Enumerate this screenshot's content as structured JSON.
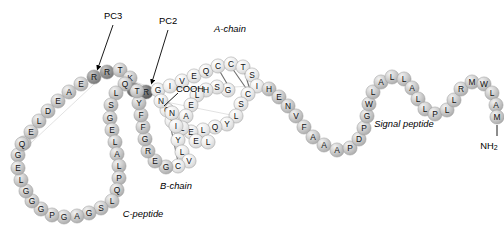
{
  "figure": {
    "background_color": "#ffffff",
    "bead_fill_light": "#e3e3e3",
    "bead_fill_mid": "#c9c9c9",
    "bead_fill_dark": "#8f8f8f",
    "bead_fill_darkest": "#6a6a6a",
    "bead_stroke": "#9a9a9a",
    "bond_color": "#6e6e6e"
  },
  "labels": {
    "pc3": "PC3",
    "pc2": "PC2",
    "a_chain": "A-chain",
    "b_chain": "B-chain",
    "c_peptide": "C-peptide",
    "signal_peptide": "Signal peptide",
    "cooh": "COOH",
    "nh2_main": "NH",
    "nh2_sub": "2"
  },
  "chart_data": {
    "type": "diagram",
    "segments": [
      {
        "name": "A-chain",
        "sequence": "GIVEQCCTSICSLYQLENYCN"
      },
      {
        "name": "B-chain",
        "sequence": "FVNQHLCGSHLVEALYLVCGERGFFYTKPT"
      },
      {
        "name": "C-peptide",
        "sequence": "EAEDLQVGQVELGGGPGAGSLQPLALEGSLQKR"
      },
      {
        "name": "Signal peptide",
        "sequence": "MALWMRLLPLLALLALWGPDPAAA"
      }
    ],
    "cleavage_sites": [
      "PC3",
      "PC2"
    ],
    "termini": [
      "NH2",
      "COOH"
    ],
    "disulfide_bonds": 3
  },
  "residues": [
    {
      "id": "r1",
      "letter": "G",
      "x": 18,
      "y": 155,
      "tone": "mid"
    },
    {
      "id": "r2",
      "letter": "V",
      "x": 24,
      "y": 143,
      "tone": "mid"
    },
    {
      "id": "r3",
      "letter": "E",
      "x": 31,
      "y": 132,
      "tone": "mid"
    },
    {
      "id": "r4",
      "letter": "L",
      "x": 39,
      "y": 121,
      "tone": "mid"
    },
    {
      "id": "r5",
      "letter": "D",
      "x": 48,
      "y": 111,
      "tone": "mid"
    },
    {
      "id": "r6",
      "letter": "E",
      "x": 58,
      "y": 101,
      "tone": "mid"
    },
    {
      "id": "r7",
      "letter": "A",
      "x": 69,
      "y": 92,
      "tone": "mid"
    },
    {
      "id": "r8",
      "letter": "E",
      "x": 81,
      "y": 84,
      "tone": "mid"
    },
    {
      "id": "r9",
      "letter": "R",
      "x": 94,
      "y": 77,
      "tone": "dark"
    },
    {
      "id": "r10",
      "letter": "R",
      "x": 107,
      "y": 72,
      "tone": "dark"
    },
    {
      "id": "r11",
      "letter": "T",
      "x": 120,
      "y": 70,
      "tone": "mid"
    },
    {
      "id": "r12",
      "letter": "K",
      "x": 130,
      "y": 78,
      "tone": "mid"
    },
    {
      "id": "r13",
      "letter": "K",
      "x": 134,
      "y": 90,
      "tone": "darkest"
    },
    {
      "id": "r14",
      "letter": "R",
      "x": 146,
      "y": 92,
      "tone": "darkest"
    },
    {
      "id": "r15",
      "letter": "G",
      "x": 158,
      "y": 90,
      "tone": "light"
    },
    {
      "id": "r16",
      "letter": "I",
      "x": 170,
      "y": 86,
      "tone": "light"
    },
    {
      "id": "r17",
      "letter": "V",
      "x": 182,
      "y": 81,
      "tone": "light"
    },
    {
      "id": "r18",
      "letter": "E",
      "x": 194,
      "y": 76,
      "tone": "light"
    },
    {
      "id": "r19",
      "letter": "Q",
      "x": 206,
      "y": 71,
      "tone": "light"
    },
    {
      "id": "r20",
      "letter": "C",
      "x": 218,
      "y": 66,
      "tone": "light"
    },
    {
      "id": "r21",
      "letter": "C",
      "x": 231,
      "y": 64,
      "tone": "light"
    },
    {
      "id": "r22",
      "letter": "T",
      "x": 243,
      "y": 67,
      "tone": "light"
    },
    {
      "id": "r23",
      "letter": "S",
      "x": 252,
      "y": 75,
      "tone": "light"
    },
    {
      "id": "r24",
      "letter": "I",
      "x": 257,
      "y": 86,
      "tone": "light"
    },
    {
      "id": "r25",
      "letter": "C",
      "x": 248,
      "y": 94,
      "tone": "light"
    },
    {
      "id": "r26",
      "letter": "S",
      "x": 241,
      "y": 104,
      "tone": "light"
    },
    {
      "id": "r27",
      "letter": "L",
      "x": 236,
      "y": 116,
      "tone": "light"
    },
    {
      "id": "r28",
      "letter": "Y",
      "x": 227,
      "y": 124,
      "tone": "light"
    },
    {
      "id": "r29",
      "letter": "Q",
      "x": 215,
      "y": 127,
      "tone": "light"
    },
    {
      "id": "r30",
      "letter": "L",
      "x": 203,
      "y": 130,
      "tone": "light"
    },
    {
      "id": "r31",
      "letter": "E",
      "x": 191,
      "y": 132,
      "tone": "light"
    },
    {
      "id": "r32",
      "letter": "N",
      "x": 180,
      "y": 129,
      "tone": "light"
    },
    {
      "id": "r33",
      "letter": "Y",
      "x": 172,
      "y": 121,
      "tone": "light"
    },
    {
      "id": "r34",
      "letter": "C",
      "x": 167,
      "y": 110,
      "tone": "light"
    },
    {
      "id": "r35",
      "letter": "N",
      "x": 161,
      "y": 101,
      "tone": "light"
    },
    {
      "id": "b1",
      "letter": "G",
      "x": 228,
      "y": 90,
      "tone": "light"
    },
    {
      "id": "b2",
      "letter": "S",
      "x": 217,
      "y": 87,
      "tone": "light"
    },
    {
      "id": "b3",
      "letter": "H",
      "x": 206,
      "y": 90,
      "tone": "light"
    },
    {
      "id": "b4",
      "letter": "L",
      "x": 197,
      "y": 95,
      "tone": "light"
    },
    {
      "id": "b5",
      "letter": "E",
      "x": 191,
      "y": 105,
      "tone": "light"
    },
    {
      "id": "b6",
      "letter": "A",
      "x": 186,
      "y": 116,
      "tone": "light"
    },
    {
      "id": "b7",
      "letter": "L",
      "x": 182,
      "y": 128,
      "tone": "light"
    },
    {
      "id": "b8",
      "letter": "Y",
      "x": 178,
      "y": 140,
      "tone": "light"
    },
    {
      "id": "b9",
      "letter": "L",
      "x": 182,
      "y": 152,
      "tone": "light"
    },
    {
      "id": "b10",
      "letter": "V",
      "x": 189,
      "y": 161,
      "tone": "light"
    },
    {
      "id": "b11",
      "letter": "C",
      "x": 178,
      "y": 166,
      "tone": "light"
    },
    {
      "id": "b12",
      "letter": "G",
      "x": 166,
      "y": 167,
      "tone": "mid"
    },
    {
      "id": "b13",
      "letter": "E",
      "x": 155,
      "y": 161,
      "tone": "mid"
    },
    {
      "id": "b14",
      "letter": "R",
      "x": 148,
      "y": 151,
      "tone": "mid"
    },
    {
      "id": "b15",
      "letter": "G",
      "x": 145,
      "y": 139,
      "tone": "mid"
    },
    {
      "id": "b16",
      "letter": "F",
      "x": 143,
      "y": 127,
      "tone": "mid"
    },
    {
      "id": "b17",
      "letter": "F",
      "x": 141,
      "y": 115,
      "tone": "mid"
    },
    {
      "id": "b18",
      "letter": "Y",
      "x": 139,
      "y": 103,
      "tone": "mid"
    },
    {
      "id": "b19",
      "letter": "T",
      "x": 137,
      "y": 91,
      "tone": "mid"
    },
    {
      "id": "bn1",
      "letter": "N",
      "x": 172,
      "y": 113,
      "tone": "light"
    },
    {
      "id": "bn2",
      "letter": "I",
      "x": 176,
      "y": 126,
      "tone": "light"
    },
    {
      "id": "bn3",
      "letter": "E",
      "x": 196,
      "y": 141,
      "tone": "light"
    },
    {
      "id": "bn4",
      "letter": "L",
      "x": 208,
      "y": 142,
      "tone": "light"
    },
    {
      "id": "c1",
      "letter": "Q",
      "x": 125,
      "y": 84,
      "tone": "mid"
    },
    {
      "id": "c2",
      "letter": "L",
      "x": 116,
      "y": 93,
      "tone": "mid"
    },
    {
      "id": "c3",
      "letter": "S",
      "x": 111,
      "y": 105,
      "tone": "mid"
    },
    {
      "id": "c4",
      "letter": "G",
      "x": 110,
      "y": 118,
      "tone": "mid"
    },
    {
      "id": "c5",
      "letter": "E",
      "x": 112,
      "y": 130,
      "tone": "mid"
    },
    {
      "id": "c6",
      "letter": "L",
      "x": 115,
      "y": 142,
      "tone": "mid"
    },
    {
      "id": "c7",
      "letter": "A",
      "x": 117,
      "y": 154,
      "tone": "mid"
    },
    {
      "id": "c8",
      "letter": "L",
      "x": 119,
      "y": 166,
      "tone": "mid"
    },
    {
      "id": "c9",
      "letter": "P",
      "x": 119,
      "y": 178,
      "tone": "mid"
    },
    {
      "id": "c10",
      "letter": "Q",
      "x": 117,
      "y": 190,
      "tone": "mid"
    },
    {
      "id": "c11",
      "letter": "L",
      "x": 112,
      "y": 201,
      "tone": "mid"
    },
    {
      "id": "c12",
      "letter": "S",
      "x": 101,
      "y": 208,
      "tone": "mid"
    },
    {
      "id": "c13",
      "letter": "G",
      "x": 89,
      "y": 213,
      "tone": "mid"
    },
    {
      "id": "c14",
      "letter": "A",
      "x": 77,
      "y": 216,
      "tone": "mid"
    },
    {
      "id": "c15",
      "letter": "G",
      "x": 64,
      "y": 217,
      "tone": "mid"
    },
    {
      "id": "c16",
      "letter": "P",
      "x": 52,
      "y": 215,
      "tone": "mid"
    },
    {
      "id": "c17",
      "letter": "G",
      "x": 41,
      "y": 209,
      "tone": "mid"
    },
    {
      "id": "c18",
      "letter": "G",
      "x": 32,
      "y": 201,
      "tone": "mid"
    },
    {
      "id": "c19",
      "letter": "G",
      "x": 26,
      "y": 191,
      "tone": "mid"
    },
    {
      "id": "c20",
      "letter": "L",
      "x": 21,
      "y": 180,
      "tone": "mid"
    },
    {
      "id": "c21",
      "letter": "E",
      "x": 18,
      "y": 168,
      "tone": "mid"
    },
    {
      "id": "c22",
      "letter": "Q",
      "x": 22,
      "y": 144,
      "tone": "mid"
    },
    {
      "id": "s1",
      "letter": "H",
      "x": 269,
      "y": 89,
      "tone": "mid"
    },
    {
      "id": "s2",
      "letter": "E",
      "x": 279,
      "y": 97,
      "tone": "mid"
    },
    {
      "id": "s3",
      "letter": "N",
      "x": 288,
      "y": 106,
      "tone": "mid"
    },
    {
      "id": "s4",
      "letter": "V",
      "x": 296,
      "y": 116,
      "tone": "mid"
    },
    {
      "id": "s5",
      "letter": "F",
      "x": 304,
      "y": 127,
      "tone": "mid"
    },
    {
      "id": "s6",
      "letter": "A",
      "x": 313,
      "y": 137,
      "tone": "mid"
    },
    {
      "id": "s7",
      "letter": "A",
      "x": 324,
      "y": 145,
      "tone": "mid"
    },
    {
      "id": "s8",
      "letter": "A",
      "x": 337,
      "y": 150,
      "tone": "mid"
    },
    {
      "id": "s9",
      "letter": "P",
      "x": 350,
      "y": 148,
      "tone": "mid"
    },
    {
      "id": "s10",
      "letter": "D",
      "x": 359,
      "y": 139,
      "tone": "mid"
    },
    {
      "id": "s11",
      "letter": "P",
      "x": 364,
      "y": 128,
      "tone": "mid"
    },
    {
      "id": "s12",
      "letter": "G",
      "x": 367,
      "y": 116,
      "tone": "mid"
    },
    {
      "id": "s13",
      "letter": "W",
      "x": 369,
      "y": 104,
      "tone": "mid"
    },
    {
      "id": "s14",
      "letter": "L",
      "x": 373,
      "y": 92,
      "tone": "mid"
    },
    {
      "id": "s15",
      "letter": "A",
      "x": 381,
      "y": 82,
      "tone": "mid"
    },
    {
      "id": "s16",
      "letter": "L",
      "x": 392,
      "y": 77,
      "tone": "mid"
    },
    {
      "id": "s17",
      "letter": "L",
      "x": 404,
      "y": 79,
      "tone": "mid"
    },
    {
      "id": "s18",
      "letter": "A",
      "x": 412,
      "y": 88,
      "tone": "mid"
    },
    {
      "id": "s19",
      "letter": "L",
      "x": 418,
      "y": 99,
      "tone": "mid"
    },
    {
      "id": "s20",
      "letter": "L",
      "x": 425,
      "y": 109,
      "tone": "mid"
    },
    {
      "id": "s21",
      "letter": "P",
      "x": 435,
      "y": 114,
      "tone": "mid"
    },
    {
      "id": "s22",
      "letter": "L",
      "x": 447,
      "y": 110,
      "tone": "mid"
    },
    {
      "id": "s23",
      "letter": "L",
      "x": 454,
      "y": 100,
      "tone": "mid"
    },
    {
      "id": "s24",
      "letter": "R",
      "x": 461,
      "y": 89,
      "tone": "mid"
    },
    {
      "id": "s25",
      "letter": "M",
      "x": 472,
      "y": 82,
      "tone": "mid"
    },
    {
      "id": "s26",
      "letter": "W",
      "x": 484,
      "y": 84,
      "tone": "mid"
    },
    {
      "id": "s27",
      "letter": "L",
      "x": 492,
      "y": 93,
      "tone": "mid"
    },
    {
      "id": "s28",
      "letter": "A",
      "x": 496,
      "y": 105,
      "tone": "mid"
    },
    {
      "id": "s29",
      "letter": "M",
      "x": 497,
      "y": 117,
      "tone": "mid"
    }
  ]
}
